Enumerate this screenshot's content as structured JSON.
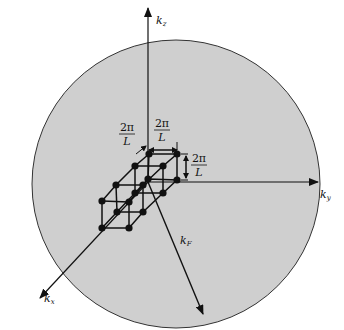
{
  "diagram": {
    "colors": {
      "sphere_fill": "#cfcfcf",
      "line": "#111111",
      "background": "#ffffff"
    },
    "axes": [
      {
        "id": "kz",
        "label": "k",
        "subscript": "z"
      },
      {
        "id": "ky",
        "label": "k",
        "subscript": "y"
      },
      {
        "id": "kx",
        "label": "k",
        "subscript": "x"
      }
    ],
    "radius_label": {
      "label": "k",
      "subscript": "F"
    },
    "spacing_labels": [
      {
        "num": "2π",
        "den": "L"
      },
      {
        "num": "2π",
        "den": "L"
      },
      {
        "num": "2π",
        "den": "L"
      }
    ]
  }
}
